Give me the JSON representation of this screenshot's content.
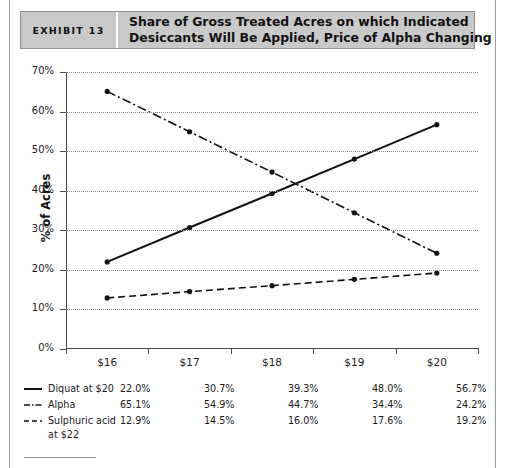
{
  "header": {
    "exhibit_label": "EXHIBIT 13",
    "title_line1": "Share of Gross Treated Acres on which Indicated",
    "title_line2": "Desiccants Will Be Applied, Price of Alpha Changing",
    "bar_color": "#c9c9c9"
  },
  "chart_data": {
    "type": "line",
    "title": "Share of Gross Treated Acres on which Indicated Desiccants Will Be Applied, Price of Alpha Changing",
    "xlabel": "",
    "ylabel": "% of Acres",
    "categories": [
      "$16",
      "$17",
      "$18",
      "$19",
      "$20"
    ],
    "ylim": [
      0,
      70
    ],
    "ytick_labels": [
      "0%",
      "10%",
      "20%",
      "30%",
      "40%",
      "50%",
      "60%",
      "70%"
    ],
    "ytick_values": [
      0,
      10,
      20,
      30,
      40,
      50,
      60,
      70
    ],
    "grid": true,
    "legend_position": "bottom-table",
    "series": [
      {
        "name": "Diquat at $20",
        "style": "solid",
        "color": "#111111",
        "values": [
          22.0,
          30.7,
          39.3,
          48.0,
          56.7
        ],
        "labels": [
          "22.0%",
          "30.7%",
          "39.3%",
          "48.0%",
          "56.7%"
        ]
      },
      {
        "name": "Alpha",
        "style": "dashdot",
        "color": "#111111",
        "values": [
          65.1,
          54.9,
          44.7,
          34.4,
          24.2
        ],
        "labels": [
          "65.1%",
          "54.9%",
          "44.7%",
          "34.4%",
          "24.2%"
        ]
      },
      {
        "name": "Sulphuric acid",
        "name_cont": "at $22",
        "style": "dashed",
        "color": "#111111",
        "values": [
          12.9,
          14.5,
          16.0,
          17.6,
          19.2
        ],
        "labels": [
          "12.9%",
          "14.5%",
          "16.0%",
          "17.6%",
          "19.2%"
        ]
      }
    ]
  }
}
